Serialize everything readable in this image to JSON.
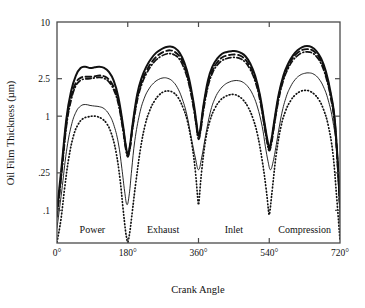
{
  "chart_data": {
    "type": "line",
    "title": "",
    "xlabel": "Crank Angle",
    "ylabel": "Oil Film Thickness (µm)",
    "x_ticklabels": [
      "0°",
      "180°",
      "360°",
      "540°",
      "720°"
    ],
    "x_tickvalues": [
      0,
      180,
      360,
      540,
      720
    ],
    "xlim": [
      0,
      720
    ],
    "y_ticklabels": [
      "10",
      "2.5",
      "1",
      ".25",
      ".1"
    ],
    "y_tickvalues": [
      10,
      2.5,
      1,
      0.25,
      0.1
    ],
    "ylim": [
      0.045,
      10
    ],
    "yscale": "log",
    "grid": false,
    "legend": "none",
    "stroke_annotations": [
      {
        "label": "Power",
        "center_deg": 90
      },
      {
        "label": "Exhaust",
        "center_deg": 270
      },
      {
        "label": "Inlet",
        "center_deg": 450
      },
      {
        "label": "Compression",
        "center_deg": 630
      }
    ],
    "series": [
      {
        "name": "curve-solid-thick",
        "style": "solid",
        "width": 2.0,
        "x": [
          0,
          12,
          24,
          36,
          48,
          60,
          72,
          84,
          96,
          108,
          120,
          132,
          144,
          156,
          168,
          174,
          180,
          186,
          192,
          204,
          216,
          228,
          240,
          252,
          264,
          276,
          288,
          300,
          312,
          324,
          336,
          348,
          354,
          360,
          366,
          372,
          384,
          396,
          408,
          420,
          432,
          444,
          456,
          468,
          480,
          492,
          504,
          516,
          528,
          534,
          540,
          546,
          552,
          564,
          576,
          588,
          600,
          612,
          624,
          636,
          648,
          660,
          672,
          684,
          696,
          708,
          720
        ],
        "y": [
          0.1,
          0.3,
          0.95,
          1.85,
          2.7,
          3.25,
          3.35,
          3.25,
          3.3,
          3.35,
          3.25,
          2.95,
          2.4,
          1.6,
          0.8,
          0.52,
          0.4,
          0.5,
          0.8,
          1.7,
          2.6,
          3.4,
          4.1,
          4.7,
          5.1,
          5.4,
          5.5,
          5.3,
          4.7,
          3.7,
          2.5,
          1.35,
          0.9,
          0.62,
          0.8,
          1.25,
          2.4,
          3.4,
          4.1,
          4.6,
          4.8,
          4.9,
          4.9,
          4.7,
          4.3,
          3.6,
          2.7,
          1.7,
          0.85,
          0.6,
          0.47,
          0.58,
          0.85,
          1.7,
          2.7,
          3.6,
          4.4,
          5.0,
          5.4,
          5.55,
          5.4,
          4.9,
          4.1,
          3.0,
          1.8,
          0.8,
          0.12
        ]
      },
      {
        "name": "curve-dashed",
        "style": "dashed",
        "width": 1.9,
        "x": [
          0,
          12,
          24,
          36,
          48,
          60,
          72,
          84,
          96,
          108,
          120,
          132,
          144,
          156,
          168,
          174,
          180,
          186,
          192,
          204,
          216,
          228,
          240,
          252,
          264,
          276,
          288,
          300,
          312,
          324,
          336,
          348,
          354,
          360,
          366,
          372,
          384,
          396,
          408,
          420,
          432,
          444,
          456,
          468,
          480,
          492,
          504,
          516,
          528,
          534,
          540,
          546,
          552,
          564,
          576,
          588,
          600,
          612,
          624,
          636,
          648,
          660,
          672,
          684,
          696,
          708,
          720
        ],
        "y": [
          0.09,
          0.27,
          0.85,
          1.6,
          2.25,
          2.55,
          2.62,
          2.62,
          2.65,
          2.7,
          2.65,
          2.45,
          2.05,
          1.45,
          0.75,
          0.5,
          0.39,
          0.48,
          0.76,
          1.55,
          2.35,
          3.05,
          3.7,
          4.25,
          4.65,
          4.9,
          5.0,
          4.8,
          4.3,
          3.4,
          2.3,
          1.25,
          0.85,
          0.6,
          0.76,
          1.18,
          2.2,
          3.1,
          3.75,
          4.2,
          4.4,
          4.5,
          4.5,
          4.35,
          3.95,
          3.3,
          2.5,
          1.6,
          0.8,
          0.57,
          0.45,
          0.55,
          0.8,
          1.6,
          2.55,
          3.4,
          4.15,
          4.7,
          5.05,
          5.15,
          5.05,
          4.6,
          3.85,
          2.8,
          1.7,
          0.75,
          0.11
        ]
      },
      {
        "name": "curve-dash-dot",
        "style": "dashdot",
        "width": 1.7,
        "x": [
          0,
          12,
          24,
          36,
          48,
          60,
          72,
          84,
          96,
          108,
          120,
          132,
          144,
          156,
          168,
          174,
          180,
          186,
          192,
          204,
          216,
          228,
          240,
          252,
          264,
          276,
          288,
          300,
          312,
          324,
          336,
          348,
          354,
          360,
          366,
          372,
          384,
          396,
          408,
          420,
          432,
          444,
          456,
          468,
          480,
          492,
          504,
          516,
          528,
          534,
          540,
          546,
          552,
          564,
          576,
          588,
          600,
          612,
          624,
          636,
          648,
          660,
          672,
          684,
          696,
          708,
          720
        ],
        "y": [
          0.085,
          0.25,
          0.78,
          1.48,
          2.1,
          2.4,
          2.48,
          2.5,
          2.55,
          2.58,
          2.52,
          2.32,
          1.92,
          1.35,
          0.7,
          0.47,
          0.37,
          0.46,
          0.72,
          1.45,
          2.2,
          2.85,
          3.45,
          3.95,
          4.3,
          4.55,
          4.62,
          4.45,
          4.0,
          3.15,
          2.15,
          1.18,
          0.8,
          0.57,
          0.72,
          1.1,
          2.05,
          2.9,
          3.5,
          3.9,
          4.1,
          4.2,
          4.2,
          4.05,
          3.7,
          3.1,
          2.35,
          1.5,
          0.76,
          0.54,
          0.43,
          0.52,
          0.76,
          1.5,
          2.4,
          3.2,
          3.9,
          4.4,
          4.72,
          4.82,
          4.72,
          4.3,
          3.6,
          2.62,
          1.6,
          0.7,
          0.105
        ]
      },
      {
        "name": "curve-solid-thin",
        "style": "solid",
        "width": 0.9,
        "x": [
          0,
          12,
          24,
          36,
          48,
          60,
          72,
          84,
          96,
          108,
          120,
          132,
          144,
          156,
          165,
          172,
          178,
          184,
          190,
          198,
          210,
          222,
          234,
          246,
          258,
          270,
          282,
          294,
          306,
          318,
          330,
          342,
          352,
          360,
          368,
          378,
          390,
          402,
          414,
          426,
          438,
          450,
          462,
          474,
          486,
          498,
          510,
          522,
          530,
          537,
          543,
          550,
          558,
          570,
          582,
          594,
          606,
          618,
          630,
          642,
          654,
          666,
          678,
          690,
          702,
          714,
          720
        ],
        "y": [
          0.065,
          0.16,
          0.42,
          0.78,
          1.1,
          1.28,
          1.33,
          1.3,
          1.28,
          1.26,
          1.2,
          1.05,
          0.82,
          0.52,
          0.28,
          0.16,
          0.115,
          0.15,
          0.27,
          0.55,
          1.05,
          1.55,
          1.95,
          2.25,
          2.45,
          2.55,
          2.52,
          2.35,
          2.02,
          1.55,
          1.05,
          0.58,
          0.36,
          0.27,
          0.36,
          0.62,
          1.1,
          1.55,
          1.9,
          2.15,
          2.3,
          2.38,
          2.38,
          2.28,
          2.05,
          1.7,
          1.25,
          0.78,
          0.48,
          0.33,
          0.27,
          0.33,
          0.5,
          0.98,
          1.55,
          2.05,
          2.45,
          2.72,
          2.85,
          2.88,
          2.78,
          2.5,
          2.05,
          1.48,
          0.88,
          0.36,
          0.075
        ]
      },
      {
        "name": "curve-dotted",
        "style": "dotted",
        "width": 1.7,
        "x": [
          0,
          10,
          20,
          30,
          42,
          54,
          66,
          78,
          90,
          102,
          114,
          126,
          138,
          150,
          160,
          168,
          174,
          178,
          180,
          182,
          186,
          192,
          200,
          212,
          224,
          236,
          248,
          260,
          272,
          284,
          296,
          308,
          320,
          332,
          344,
          352,
          358,
          360,
          362,
          368,
          378,
          390,
          402,
          414,
          426,
          438,
          450,
          462,
          474,
          486,
          498,
          510,
          522,
          532,
          538,
          540,
          542,
          548,
          558,
          570,
          582,
          594,
          606,
          618,
          630,
          642,
          654,
          666,
          678,
          690,
          702,
          712,
          720
        ],
        "y": [
          0.046,
          0.08,
          0.18,
          0.36,
          0.62,
          0.82,
          0.94,
          0.98,
          1.0,
          0.99,
          0.94,
          0.84,
          0.66,
          0.42,
          0.22,
          0.105,
          0.062,
          0.049,
          0.046,
          0.049,
          0.062,
          0.1,
          0.19,
          0.44,
          0.8,
          1.15,
          1.45,
          1.68,
          1.82,
          1.85,
          1.78,
          1.58,
          1.25,
          0.88,
          0.48,
          0.26,
          0.135,
          0.115,
          0.135,
          0.26,
          0.56,
          0.92,
          1.22,
          1.45,
          1.6,
          1.68,
          1.7,
          1.63,
          1.48,
          1.25,
          0.96,
          0.64,
          0.34,
          0.17,
          0.1,
          0.09,
          0.1,
          0.17,
          0.4,
          0.78,
          1.15,
          1.45,
          1.68,
          1.82,
          1.88,
          1.85,
          1.72,
          1.5,
          1.18,
          0.8,
          0.4,
          0.13,
          0.048
        ]
      }
    ]
  },
  "colors": {
    "axis": "#4a4a4a",
    "curve": "#111111",
    "background": "#ffffff"
  }
}
